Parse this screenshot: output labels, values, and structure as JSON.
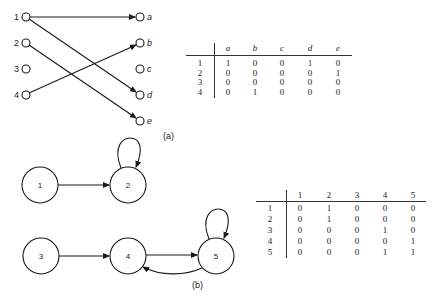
{
  "part_a": {
    "caption": "(a)",
    "left_nodes": [
      "1",
      "2",
      "3",
      "4"
    ],
    "right_nodes": [
      "a",
      "b",
      "c",
      "d",
      "e"
    ],
    "edges": [
      [
        "1",
        "a"
      ],
      [
        "1",
        "d"
      ],
      [
        "2",
        "e"
      ],
      [
        "4",
        "b"
      ]
    ],
    "matrix": {
      "columns": [
        "a",
        "b",
        "c",
        "d",
        "e"
      ],
      "rows": [
        {
          "label": "1",
          "values": [
            "1",
            "0",
            "0",
            "1",
            "0"
          ]
        },
        {
          "label": "2",
          "values": [
            "0",
            "0",
            "0",
            "0",
            "1"
          ]
        },
        {
          "label": "3",
          "values": [
            "0",
            "0",
            "0",
            "0",
            "0"
          ]
        },
        {
          "label": "4",
          "values": [
            "0",
            "1",
            "0",
            "0",
            "0"
          ]
        }
      ]
    }
  },
  "part_b": {
    "caption": "(b)",
    "nodes": [
      "1",
      "2",
      "3",
      "4",
      "5"
    ],
    "edges": [
      [
        "1",
        "2"
      ],
      [
        "2",
        "2"
      ],
      [
        "3",
        "4"
      ],
      [
        "4",
        "5"
      ],
      [
        "5",
        "4"
      ],
      [
        "5",
        "5"
      ]
    ],
    "matrix": {
      "columns": [
        "1",
        "2",
        "3",
        "4",
        "5"
      ],
      "rows": [
        {
          "label": "1",
          "values": [
            "0",
            "1",
            "0",
            "0",
            "0"
          ]
        },
        {
          "label": "2",
          "values": [
            "0",
            "1",
            "0",
            "0",
            "0"
          ]
        },
        {
          "label": "3",
          "values": [
            "0",
            "0",
            "0",
            "1",
            "0"
          ]
        },
        {
          "label": "4",
          "values": [
            "0",
            "0",
            "0",
            "0",
            "1"
          ]
        },
        {
          "label": "5",
          "values": [
            "0",
            "0",
            "0",
            "1",
            "1"
          ]
        }
      ]
    }
  }
}
